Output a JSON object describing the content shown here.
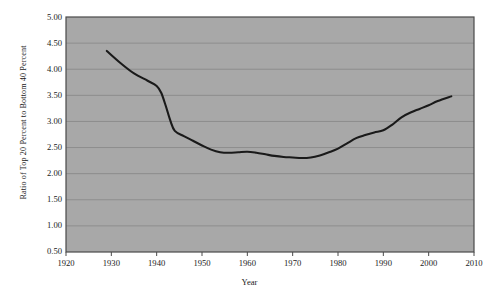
{
  "chart_data": {
    "type": "line",
    "title": "",
    "xlabel": "Year",
    "ylabel": "Ratio of Top 20 Percent to Bottom 40 Percent",
    "xlim": [
      1920,
      2010
    ],
    "ylim": [
      0.5,
      5.0
    ],
    "xticks": [
      1920,
      1930,
      1940,
      1950,
      1960,
      1970,
      1980,
      1990,
      2000,
      2010
    ],
    "xtick_labels": [
      "1920",
      "1930",
      "1940",
      "1950",
      "1960",
      "1970",
      "1980",
      "1990",
      "2000",
      "2010"
    ],
    "yticks": [
      0.5,
      1.0,
      1.5,
      2.0,
      2.5,
      3.0,
      3.5,
      4.0,
      4.5,
      5.0
    ],
    "ytick_labels": [
      "0.50",
      "1.00",
      "1.50",
      "2.00",
      "2.50",
      "3.00",
      "3.50",
      "4.00",
      "4.50",
      "5.00"
    ],
    "grid": "horizontal",
    "legend": "none",
    "plot_background": "#a8a8a8",
    "line_color": "#1a1a1a",
    "gridline_color": "#8d8d8d",
    "border_color": "#4a4a4a",
    "x": [
      1929,
      1932,
      1935,
      1938,
      1940,
      1941,
      1942,
      1943,
      1944,
      1946,
      1948,
      1950,
      1952,
      1954,
      1956,
      1958,
      1960,
      1962,
      1964,
      1966,
      1968,
      1970,
      1972,
      1974,
      1976,
      1978,
      1980,
      1982,
      1984,
      1986,
      1988,
      1990,
      1992,
      1994,
      1996,
      1998,
      2000,
      2002,
      2005
    ],
    "values": [
      4.35,
      4.12,
      3.92,
      3.78,
      3.68,
      3.55,
      3.3,
      3.02,
      2.82,
      2.72,
      2.63,
      2.54,
      2.46,
      2.41,
      2.4,
      2.41,
      2.42,
      2.4,
      2.37,
      2.34,
      2.32,
      2.31,
      2.3,
      2.31,
      2.35,
      2.41,
      2.48,
      2.58,
      2.68,
      2.74,
      2.79,
      2.83,
      2.94,
      3.08,
      3.17,
      3.24,
      3.31,
      3.39,
      3.48
    ],
    "series_name": "Ratio of Top 20 Percent to Bottom 40 Percent",
    "annotations": []
  }
}
